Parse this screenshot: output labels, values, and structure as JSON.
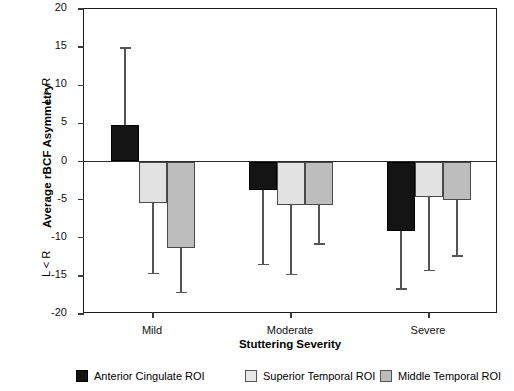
{
  "chart_data": {
    "type": "bar",
    "title": "",
    "xlabel": "Stuttering Severity",
    "ylabel": "Average rBCF Asymmetry",
    "ylim": [
      -20,
      20
    ],
    "ytick_labels": [
      "20",
      "15",
      "10",
      "5",
      "0",
      "-5",
      "-10",
      "-15",
      "-20"
    ],
    "ytick_values": [
      20,
      15,
      10,
      5,
      0,
      -5,
      -10,
      -15,
      -20
    ],
    "grid": false,
    "legend_position": "bottom",
    "axis_direction_upper": "L > R",
    "axis_direction_lower": "L < R",
    "categories": [
      "Mild",
      "Moderate",
      "Severe"
    ],
    "series": [
      {
        "name": "Anterior Cingulate ROI",
        "color": "#141414",
        "values": [
          4.8,
          -3.7,
          -9.1
        ],
        "errors": [
          10.1,
          9.8,
          7.6
        ],
        "error_extent": [
          14.9,
          -13.5,
          -16.7
        ]
      },
      {
        "name": "Superior Temporal ROI",
        "color": "#e2e2e2",
        "values": [
          -5.5,
          -5.7,
          -4.7
        ],
        "errors": [
          9.2,
          9.1,
          9.6
        ],
        "error_extent": [
          -14.7,
          -14.8,
          -14.3
        ]
      },
      {
        "name": "Middle Temporal ROI",
        "color": "#bdbdbd",
        "values": [
          -11.3,
          -5.7,
          -5.1
        ],
        "errors": [
          5.9,
          5.1,
          7.3
        ],
        "error_extent": [
          -17.2,
          -10.8,
          -12.4
        ]
      }
    ]
  },
  "legend": {
    "items": [
      {
        "label": "Anterior Cingulate ROI"
      },
      {
        "label": "Superior Temporal ROI"
      },
      {
        "label": "Middle Temporal ROI"
      }
    ]
  }
}
